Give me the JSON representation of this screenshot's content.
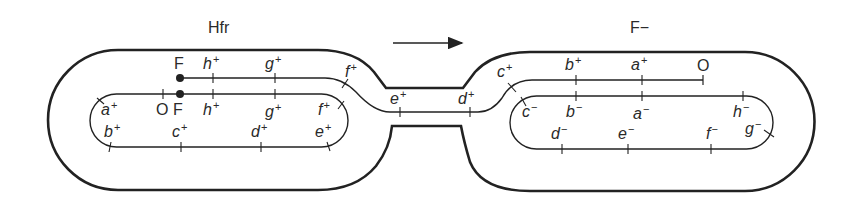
{
  "diagram": {
    "type": "bacterial conjugation",
    "arrow_direction": "right",
    "colors": {
      "stroke": "#222222",
      "text": "#2a2a2a",
      "background": "#ffffff"
    }
  },
  "cells": {
    "donor": {
      "title": "Hfr",
      "chromosome_top_labels": [
        {
          "text": "O",
          "type": "mark"
        },
        {
          "text": "F",
          "type": "mark"
        },
        {
          "gene": "h",
          "sign": "+"
        },
        {
          "gene": "g",
          "sign": "+"
        },
        {
          "gene": "f",
          "sign": "+"
        }
      ],
      "chromosome_left_labels": [
        {
          "gene": "a",
          "sign": "+"
        },
        {
          "gene": "b",
          "sign": "+"
        }
      ],
      "chromosome_bottom_labels": [
        {
          "gene": "c",
          "sign": "+"
        },
        {
          "gene": "d",
          "sign": "+"
        },
        {
          "gene": "e",
          "sign": "+"
        }
      ],
      "transfer_strand_labels": [
        {
          "text": "F",
          "type": "mark"
        },
        {
          "gene": "h",
          "sign": "+"
        },
        {
          "gene": "g",
          "sign": "+"
        },
        {
          "gene": "f",
          "sign": "+"
        }
      ]
    },
    "bridge": {
      "labels": [
        {
          "gene": "e",
          "sign": "+"
        },
        {
          "gene": "d",
          "sign": "+"
        }
      ]
    },
    "recipient": {
      "title": "F−",
      "transfer_strand_labels": [
        {
          "gene": "c",
          "sign": "+"
        },
        {
          "gene": "b",
          "sign": "+"
        },
        {
          "gene": "a",
          "sign": "+"
        },
        {
          "text": "O",
          "type": "mark"
        }
      ],
      "chromosome_top_labels": [
        {
          "gene": "c",
          "sign": "−"
        },
        {
          "gene": "b",
          "sign": "−"
        },
        {
          "gene": "a",
          "sign": "−"
        },
        {
          "gene": "h",
          "sign": "−"
        }
      ],
      "chromosome_bottom_labels": [
        {
          "gene": "d",
          "sign": "−"
        },
        {
          "gene": "e",
          "sign": "−"
        },
        {
          "gene": "f",
          "sign": "−"
        },
        {
          "gene": "g",
          "sign": "−"
        }
      ]
    }
  }
}
